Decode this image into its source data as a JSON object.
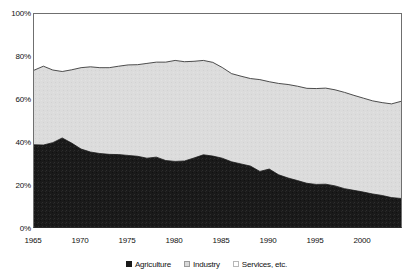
{
  "chart_data": {
    "type": "area",
    "stacked": true,
    "title": "",
    "subtitle": "",
    "xlabel": "",
    "ylabel": "",
    "xlim": [
      1965,
      2004
    ],
    "ylim": [
      0,
      100
    ],
    "grid": false,
    "legend_position": "bottom-center",
    "y_tick_labels": [
      "100%",
      "80%",
      "60%",
      "40%",
      "20%",
      "0%"
    ],
    "y_ticks": [
      100,
      80,
      60,
      40,
      20,
      0
    ],
    "x_tick_labels": [
      "1965",
      "1970",
      "1975",
      "1980",
      "1985",
      "1990",
      "1995",
      "2000"
    ],
    "x_ticks": [
      1965,
      1970,
      1975,
      1980,
      1985,
      1990,
      1995,
      2000
    ],
    "x": [
      1965,
      1966,
      1967,
      1968,
      1969,
      1970,
      1971,
      1972,
      1973,
      1974,
      1975,
      1976,
      1977,
      1978,
      1979,
      1980,
      1981,
      1982,
      1983,
      1984,
      1985,
      1986,
      1987,
      1988,
      1989,
      1990,
      1991,
      1992,
      1993,
      1994,
      1995,
      1996,
      1997,
      1998,
      1999,
      2000,
      2001,
      2002,
      2003,
      2004
    ],
    "series": [
      {
        "name": "Agriculture",
        "color": "#1a1a1a",
        "values": [
          38.6,
          38.5,
          39.6,
          41.8,
          39.4,
          36.6,
          35.2,
          34.5,
          34.1,
          34.0,
          33.6,
          33.2,
          32.3,
          32.8,
          31.2,
          30.8,
          31.0,
          32.4,
          33.9,
          33.3,
          32.3,
          30.6,
          29.6,
          28.6,
          26.1,
          27.2,
          24.5,
          23.0,
          21.8,
          20.5,
          20.0,
          20.1,
          19.3,
          18.0,
          17.2,
          16.4,
          15.5,
          14.8,
          13.8,
          13.4
        ]
      },
      {
        "name": "Industry",
        "color": "#d9d9d9",
        "values": [
          35.0,
          37.0,
          34.1,
          31.2,
          34.4,
          38.2,
          40.0,
          40.3,
          40.7,
          41.5,
          42.5,
          43.0,
          44.5,
          44.6,
          46.2,
          47.4,
          46.6,
          45.4,
          44.3,
          44.0,
          42.6,
          41.4,
          41.2,
          41.1,
          43.1,
          41.0,
          42.9,
          43.9,
          44.3,
          44.6,
          45.0,
          45.1,
          45.1,
          45.2,
          44.6,
          44.1,
          43.7,
          43.6,
          44.0,
          45.6
        ]
      },
      {
        "name": "Services, etc.",
        "color": "#ffffff",
        "values": [
          26.4,
          24.5,
          26.3,
          27.0,
          26.2,
          25.2,
          24.8,
          25.2,
          25.2,
          24.5,
          23.9,
          23.8,
          23.2,
          22.6,
          22.6,
          21.8,
          22.4,
          22.2,
          21.8,
          22.7,
          25.1,
          28.0,
          29.2,
          30.3,
          30.8,
          31.8,
          32.6,
          33.1,
          33.9,
          34.9,
          35.0,
          34.8,
          35.6,
          36.8,
          38.2,
          39.5,
          40.8,
          41.6,
          42.2,
          41.0
        ]
      }
    ],
    "cumulative_top_agriculture": [
      38.6,
      38.5,
      39.6,
      41.8,
      39.4,
      36.6,
      35.2,
      34.5,
      34.1,
      34.0,
      33.6,
      33.2,
      32.3,
      32.8,
      31.2,
      30.8,
      31.0,
      32.4,
      33.9,
      33.3,
      32.3,
      30.6,
      29.6,
      28.6,
      26.1,
      27.2,
      24.5,
      23.0,
      21.8,
      20.5,
      20.0,
      20.1,
      19.3,
      18.0,
      17.2,
      16.4,
      15.5,
      14.8,
      13.8,
      13.4
    ],
    "cumulative_top_industry": [
      73.6,
      75.5,
      73.7,
      73.0,
      73.8,
      74.8,
      75.2,
      74.8,
      74.8,
      75.5,
      76.1,
      76.2,
      76.8,
      77.4,
      77.4,
      78.2,
      77.6,
      77.8,
      78.2,
      77.3,
      74.9,
      72.0,
      70.8,
      69.7,
      69.2,
      68.2,
      67.4,
      66.9,
      66.1,
      65.1,
      65.0,
      65.2,
      64.4,
      63.2,
      61.8,
      60.5,
      59.2,
      58.4,
      57.8,
      59.0
    ]
  },
  "axes": {
    "y_labels": [
      "100%",
      "80%",
      "60%",
      "40%",
      "20%",
      "0%"
    ],
    "x_labels": [
      "1965",
      "1970",
      "1975",
      "1980",
      "1985",
      "1990",
      "1995",
      "2000"
    ]
  },
  "legend": {
    "items": [
      {
        "label": "Agriculture",
        "swatch": "black-square",
        "color": "#1a1a1a"
      },
      {
        "label": "Industry",
        "swatch": "gray-square",
        "color": "#d9d9d9"
      },
      {
        "label": "Services, etc.",
        "swatch": "white-square",
        "color": "#ffffff"
      }
    ]
  }
}
